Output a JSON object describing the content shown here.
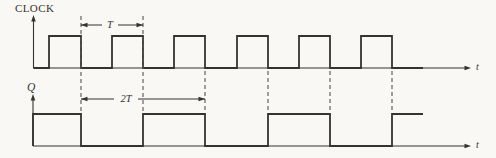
{
  "figure": {
    "type": "timing-diagram",
    "width": 496,
    "height": 158,
    "background": "#f9f8f5",
    "ink_color": "#35332f",
    "guide_color": "#56534e"
  },
  "signals": [
    {
      "name": "clock",
      "label": "CLOCK",
      "axis_label": "t",
      "axis": {
        "x": 33.5,
        "y_top": 15,
        "y_base": 68,
        "x_end": 471
      },
      "high_y": 36,
      "initial_level": 0,
      "toggle_xs": [
        49,
        81,
        112,
        143,
        174,
        205,
        237,
        268,
        299,
        330,
        361,
        392
      ],
      "end_x": 423
    },
    {
      "name": "q",
      "label": "Q",
      "axis_label": "t",
      "axis": {
        "x": 33,
        "y_top": 94,
        "y_base": 146,
        "x_end": 471
      },
      "high_y": 114,
      "initial_level": 1,
      "toggle_xs": [
        81,
        143,
        205,
        268,
        330,
        392
      ],
      "end_x": 423
    }
  ],
  "dashed_guides": [
    {
      "x": 81,
      "y1": 16,
      "y2": 113
    },
    {
      "x": 143,
      "y1": 16,
      "y2": 113
    },
    {
      "x": 205,
      "y1": 71,
      "y2": 113
    },
    {
      "x": 268,
      "y1": 71,
      "y2": 113
    },
    {
      "x": 330,
      "y1": 71,
      "y2": 113
    },
    {
      "x": 392,
      "y1": 71,
      "y2": 113
    }
  ],
  "measurements": [
    {
      "label": "T",
      "x1": 81,
      "x2": 143,
      "y": 25,
      "label_x": 110,
      "gap": 16
    },
    {
      "label": "2T",
      "x1": 81,
      "x2": 205,
      "y": 99,
      "label_x": 126,
      "gap": 24
    }
  ]
}
